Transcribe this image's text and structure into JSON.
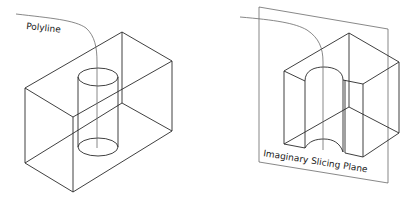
{
  "figures": [
    {
      "id": "solid-with-cylinder",
      "labels": {
        "polyline": "Polyline"
      }
    },
    {
      "id": "sliced-solid",
      "labels": {
        "plane": "Imaginary Slicing Plane"
      }
    }
  ],
  "colors": {
    "line": "#2a2a2a",
    "polyline": "#6a6a6a",
    "background": "#ffffff"
  }
}
